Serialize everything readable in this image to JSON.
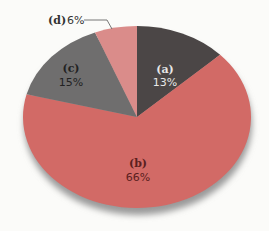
{
  "chart_data": {
    "type": "pie",
    "title": "",
    "categories": [
      "(a)",
      "(b)",
      "(c)",
      "(d)"
    ],
    "values": [
      13,
      66,
      15,
      6
    ],
    "unit": "%",
    "colors": [
      "#4b4646",
      "#d26a66",
      "#6f6e6e",
      "#da8c8a"
    ],
    "labels": [
      {
        "key": "a",
        "text": "13%"
      },
      {
        "key": "b",
        "text": "66%"
      },
      {
        "key": "c",
        "text": "15%"
      },
      {
        "key": "d",
        "text": "6%"
      }
    ],
    "legend": "none",
    "annotations": [
      "(d) 6% label with leader line"
    ]
  },
  "labels": {
    "a_key": "(a)",
    "a_val": "13%",
    "b_key": "(b)",
    "b_val": "66%",
    "c_key": "(c)",
    "c_val": "15%",
    "d_key": "(d)",
    "d_val": "6%"
  }
}
